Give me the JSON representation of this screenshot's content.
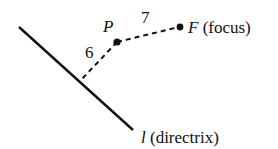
{
  "diagram": {
    "point_label": "P",
    "focus_letter": "F",
    "focus_text": "(focus)",
    "directrix_letter": "l",
    "directrix_text": "(directrix)",
    "distance_to_focus": "7",
    "distance_to_directrix": "6",
    "line_color": "#111111"
  }
}
